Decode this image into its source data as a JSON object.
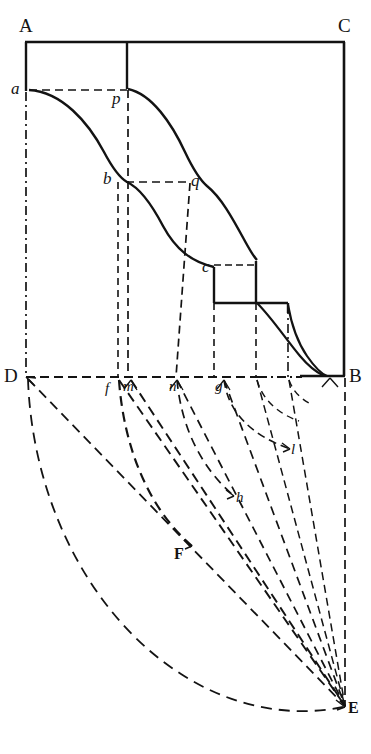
{
  "figure": {
    "background_color": "#ffffff",
    "ink_color": "#131313",
    "width": 371,
    "height": 754
  },
  "labels": {
    "A": "A",
    "C": "C",
    "B": "B",
    "D": "D",
    "E": "E",
    "F": "F",
    "a": "a",
    "p": "p",
    "b": "b",
    "q": "q",
    "c": "c",
    "f": "f",
    "m": "m",
    "n": "n",
    "g": "g",
    "h": "h",
    "l": "l"
  },
  "points": {
    "A": {
      "x": 25,
      "y": 42
    },
    "C": {
      "x": 345,
      "y": 42
    },
    "B": {
      "x": 345,
      "y": 376
    },
    "D": {
      "x": 26,
      "y": 377
    },
    "E": {
      "x": 345,
      "y": 707
    },
    "F": {
      "x": 192,
      "y": 546
    },
    "a": {
      "x": 30,
      "y": 90
    },
    "p": {
      "x": 128,
      "y": 89
    },
    "b": {
      "x": 126,
      "y": 182
    },
    "q": {
      "x": 190,
      "y": 183
    },
    "c": {
      "x": 214,
      "y": 268
    },
    "f": {
      "x": 118,
      "y": 377
    },
    "m": {
      "x": 131,
      "y": 377
    },
    "n": {
      "x": 176,
      "y": 377
    },
    "g": {
      "x": 223,
      "y": 377
    },
    "h": {
      "x": 234,
      "y": 496
    },
    "l": {
      "x": 290,
      "y": 449
    }
  },
  "geometry": {
    "frame": {
      "top_left": "A",
      "top_right": "C",
      "bottom_right": "B",
      "bottom_left": "D",
      "description": "rectangle A-C-B-D with solid top and right edges"
    },
    "vertical_divider_x": 128,
    "step_levels": [
      268,
      303
    ],
    "step_x_breaks": [
      214,
      256,
      288,
      345
    ],
    "curve_description": "two parallel descending curves from a/p down through b/q and c to B, with two rectangular steps near B",
    "arcs": [
      {
        "from": "D",
        "to": "E",
        "center": "E",
        "style": "dashed"
      },
      {
        "from": "f",
        "to": "E",
        "center": "E",
        "style": "dashed"
      },
      {
        "from": "n",
        "to": "E",
        "center": "E",
        "style": "dashed"
      },
      {
        "from": "g",
        "to": "E",
        "center": "E",
        "style": "dashed"
      }
    ],
    "radials": [
      {
        "from": "D",
        "to": "E"
      },
      {
        "from": "f",
        "to": "E"
      },
      {
        "from": "m",
        "to": "E"
      },
      {
        "from": "n",
        "to": "E"
      },
      {
        "from": "g",
        "to": "E"
      }
    ]
  }
}
